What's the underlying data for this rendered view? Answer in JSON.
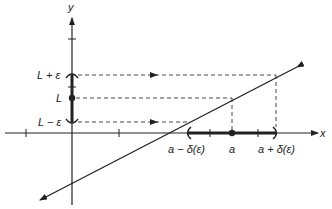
{
  "diagram": {
    "axes": {
      "x_label": "x",
      "y_label": "y"
    },
    "y_labels": {
      "upper": "L + ε",
      "center": "L",
      "lower": "L − ε"
    },
    "x_labels": {
      "left": "a − δ(ε)",
      "center": "a",
      "right": "a + δ(ε)"
    },
    "colors": {
      "ink": "#222222",
      "background": "#ffffff"
    }
  }
}
